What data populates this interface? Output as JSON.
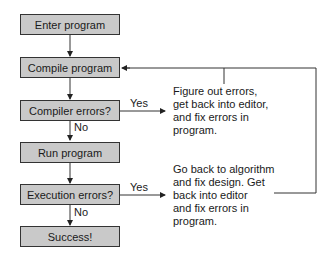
{
  "flowchart": {
    "steps": [
      {
        "id": "enter",
        "label": "Enter program"
      },
      {
        "id": "compile",
        "label": "Compile program"
      },
      {
        "id": "compiler_errors",
        "label": "Compiler errors?"
      },
      {
        "id": "run",
        "label": "Run program"
      },
      {
        "id": "execution_errors",
        "label": "Execution errors?"
      },
      {
        "id": "success",
        "label": "Success!"
      }
    ],
    "branches": {
      "compiler_yes": "Yes",
      "compiler_no": "No",
      "execution_yes": "Yes",
      "execution_no": "No"
    },
    "notes": {
      "compiler_fix": "Figure out errors,\nget back into editor,\nand fix errors in\nprogram.",
      "execution_fix": "Go back to algorithm\nand fix design. Get\nback into editor\nand fix errors in\nprogram."
    },
    "colors": {
      "box_fill": "#c9c9c9",
      "line": "#333333"
    }
  }
}
